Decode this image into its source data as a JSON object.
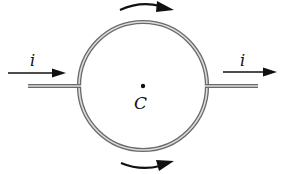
{
  "figure": {
    "type": "circuit-diagram"
  },
  "labels": {
    "current_in": "i",
    "current_out": "i",
    "center": "C"
  },
  "arrows": {
    "input_current": "right",
    "output_current": "right",
    "top_arc": "clockwise",
    "bottom_arc": "counterclockwise"
  },
  "colors": {
    "wire_outer": "#6a6a6a",
    "wire_inner": "#d8d8d8",
    "arrow": "#111111",
    "background": "#ffffff"
  }
}
